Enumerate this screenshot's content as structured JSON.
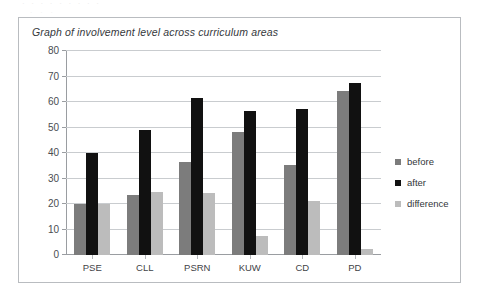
{
  "page": {
    "scan_residue_line1": "·  ·   ·    ·     ·      ·       ·        ·         ·",
    "scan_residue_line2": "·   ·    ·"
  },
  "chart_data": {
    "type": "bar",
    "title": "Graph of involvement level across curriculum areas",
    "xlabel": "",
    "ylabel": "",
    "ylim": [
      0,
      80
    ],
    "ytick_step": 10,
    "grid": true,
    "legend_position": "right",
    "categories": [
      "PSE",
      "CLL",
      "PSRN",
      "KUW",
      "CD",
      "PD"
    ],
    "ytick_labels": [
      "80",
      "70",
      "60",
      "50",
      "40",
      "30",
      "20",
      "10",
      "0"
    ],
    "ytick_values": [
      80,
      70,
      60,
      50,
      40,
      30,
      20,
      10,
      0
    ],
    "series": [
      {
        "name": "before",
        "color": "#7c7c7c",
        "values": [
          20,
          23.6,
          36.5,
          48.3,
          35.3,
          64.3
        ]
      },
      {
        "name": "after",
        "color": "#111111",
        "values": [
          40,
          49,
          61.5,
          56.3,
          57.3,
          67.3
        ]
      },
      {
        "name": "difference",
        "color": "#bcbcbc",
        "values": [
          20,
          24.8,
          24.5,
          7.5,
          21.3,
          2.3
        ]
      }
    ]
  }
}
